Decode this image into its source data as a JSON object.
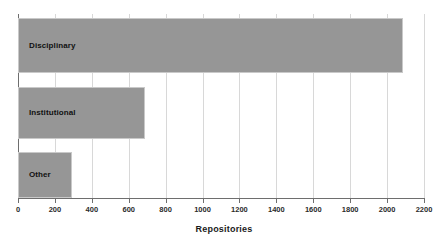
{
  "chart_data": {
    "type": "bar",
    "orientation": "horizontal",
    "title": "",
    "xlabel": "Repositories",
    "ylabel": "",
    "categories": [
      "Disciplinary",
      "Institutional",
      "Other"
    ],
    "values": [
      2085,
      690,
      295
    ],
    "series": [
      {
        "name": "Repositories",
        "values": [
          2085,
          690,
          295
        ]
      }
    ],
    "xlim": [
      0,
      2200
    ],
    "xticks": [
      0,
      200,
      400,
      600,
      800,
      1000,
      1200,
      1400,
      1600,
      1800,
      2000,
      2200
    ],
    "xtick_labels": [
      "0",
      "200",
      "400",
      "600",
      "800",
      "1000",
      "1200",
      "1400",
      "1600",
      "1800",
      "2000",
      "2200"
    ],
    "grid": true,
    "grid_axis": "x",
    "legend": false,
    "bar_color": "#969696",
    "bar_border_color": "#c9c9c9",
    "gridline_color": "#d8d8d8",
    "axis_color": "#6e6e6e",
    "label_color": "#111111",
    "background": "#ffffff",
    "bars": [
      {
        "label": "Disciplinary",
        "value": 2085
      },
      {
        "label": "Institutional",
        "value": 690
      },
      {
        "label": "Other",
        "value": 295
      }
    ]
  }
}
